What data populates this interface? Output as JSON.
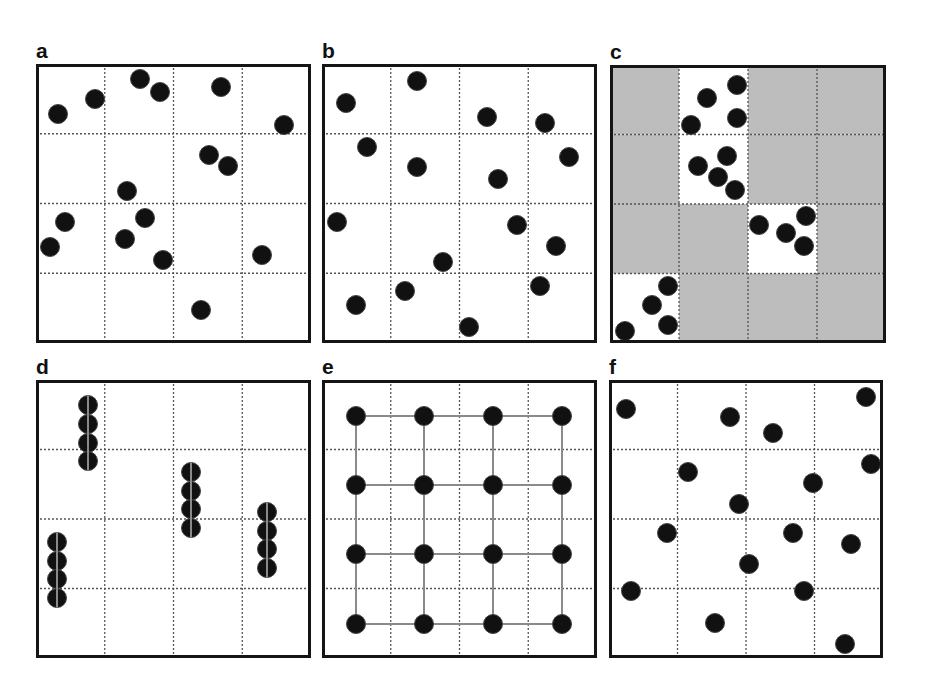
{
  "figure": {
    "style": {
      "frame_color": "#151515",
      "grid_color": "#555555",
      "dot_color": "#111111",
      "dot_edge_color": "#444444",
      "shaded_cell_color": "#bdbdbd",
      "link_color": "#8a8a8a",
      "dot_radius": 9.5
    },
    "panels": [
      {
        "id": "a",
        "label": "a",
        "pattern": "random",
        "left": 36,
        "top": 64,
        "width": 275,
        "height": 279
      },
      {
        "id": "b",
        "label": "b",
        "pattern": "random",
        "left": 322,
        "top": 64,
        "width": 275,
        "height": 279
      },
      {
        "id": "c",
        "label": "c",
        "pattern": "clustered",
        "left": 610,
        "top": 65,
        "width": 276,
        "height": 278
      },
      {
        "id": "d",
        "label": "d",
        "pattern": "linear-chains",
        "left": 36,
        "top": 380,
        "width": 275,
        "height": 278
      },
      {
        "id": "e",
        "label": "e",
        "pattern": "regular-lattice",
        "left": 322,
        "top": 380,
        "width": 275,
        "height": 278
      },
      {
        "id": "f",
        "label": "f",
        "pattern": "random",
        "left": 609,
        "top": 380,
        "width": 274,
        "height": 278
      }
    ]
  },
  "chart_data": [
    {
      "panel": "a",
      "type": "scatter",
      "title": "a",
      "grid": {
        "rows": 4,
        "cols": 4,
        "style": "dotted"
      },
      "points": [
        [
          22,
          50
        ],
        [
          59,
          35
        ],
        [
          104,
          15
        ],
        [
          124,
          28
        ],
        [
          185,
          23
        ],
        [
          248,
          61
        ],
        [
          173,
          91
        ],
        [
          192,
          102
        ],
        [
          91,
          127
        ],
        [
          29,
          158
        ],
        [
          14,
          183
        ],
        [
          109,
          154
        ],
        [
          89,
          175
        ],
        [
          127,
          196
        ],
        [
          226,
          191
        ],
        [
          165,
          246
        ]
      ]
    },
    {
      "panel": "b",
      "type": "scatter",
      "title": "b",
      "grid": {
        "rows": 4,
        "cols": 4,
        "style": "dotted"
      },
      "points": [
        [
          24,
          39
        ],
        [
          95,
          17
        ],
        [
          165,
          53
        ],
        [
          223,
          59
        ],
        [
          45,
          83
        ],
        [
          95,
          103
        ],
        [
          176,
          115
        ],
        [
          247,
          93
        ],
        [
          15,
          158
        ],
        [
          195,
          161
        ],
        [
          234,
          182
        ],
        [
          121,
          198
        ],
        [
          83,
          227
        ],
        [
          218,
          222
        ],
        [
          34,
          241
        ],
        [
          147,
          263
        ]
      ]
    },
    {
      "panel": "c",
      "type": "scatter",
      "title": "c",
      "grid": {
        "rows": 4,
        "cols": 4,
        "style": "dotted"
      },
      "white_cells": [
        [
          0,
          1
        ],
        [
          1,
          1
        ],
        [
          2,
          2
        ],
        [
          3,
          0
        ]
      ],
      "shaded_cells_note": "all other cells shaded grey",
      "points": [
        [
          127,
          20
        ],
        [
          97,
          33
        ],
        [
          127,
          53
        ],
        [
          81,
          60
        ],
        [
          117,
          91
        ],
        [
          88,
          101
        ],
        [
          108,
          112
        ],
        [
          125,
          125
        ],
        [
          196,
          151
        ],
        [
          149,
          160
        ],
        [
          176,
          168
        ],
        [
          194,
          181
        ],
        [
          58,
          221
        ],
        [
          42,
          240
        ],
        [
          58,
          260
        ],
        [
          15,
          266
        ]
      ]
    },
    {
      "panel": "d",
      "type": "scatter",
      "title": "d",
      "grid": {
        "rows": 4,
        "cols": 4,
        "style": "dotted"
      },
      "chains": [
        {
          "x": 52,
          "ys": [
            25,
            44,
            63,
            81
          ]
        },
        {
          "x": 155,
          "ys": [
            92,
            111,
            129,
            148
          ]
        },
        {
          "x": 231,
          "ys": [
            132,
            151,
            169,
            188
          ]
        },
        {
          "x": 21,
          "ys": [
            162,
            181,
            199,
            218
          ]
        }
      ]
    },
    {
      "panel": "e",
      "type": "scatter",
      "title": "e",
      "grid": {
        "rows": 4,
        "cols": 4,
        "style": "dotted"
      },
      "lattice": {
        "xs": [
          34,
          102,
          171,
          240
        ],
        "ys": [
          36,
          105,
          174,
          244
        ],
        "connected": true
      }
    },
    {
      "panel": "f",
      "type": "scatter",
      "title": "f",
      "grid": {
        "rows": 4,
        "cols": 4,
        "style": "dotted"
      },
      "points": [
        [
          17,
          29
        ],
        [
          121,
          37
        ],
        [
          164,
          53
        ],
        [
          257,
          17
        ],
        [
          262,
          84
        ],
        [
          79,
          92
        ],
        [
          204,
          103
        ],
        [
          130,
          124
        ],
        [
          58,
          153
        ],
        [
          184,
          153
        ],
        [
          242,
          164
        ],
        [
          140,
          184
        ],
        [
          22,
          211
        ],
        [
          195,
          211
        ],
        [
          106,
          243
        ],
        [
          236,
          264
        ]
      ]
    }
  ]
}
